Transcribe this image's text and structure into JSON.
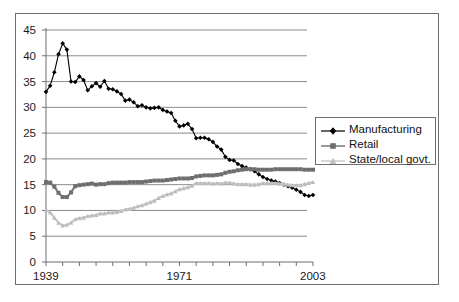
{
  "chart_data": {
    "type": "line",
    "title": "",
    "subtitle": "",
    "xlabel": "",
    "ylabel": "",
    "xlim": [
      1939,
      2003
    ],
    "ylim": [
      0,
      45
    ],
    "grid": true,
    "grid_axis": "y",
    "legend_position": "inside-right",
    "ytick_labels": [
      "0",
      "5",
      "10",
      "15",
      "20",
      "25",
      "30",
      "35",
      "40",
      "45"
    ],
    "ytick_values": [
      0,
      5,
      10,
      15,
      20,
      25,
      30,
      35,
      40,
      45
    ],
    "xtick_labels": [
      "1939",
      "1971",
      "2003"
    ],
    "xtick_values": [
      1939,
      1971,
      2003
    ],
    "xtick_minor_step": 4,
    "colors": {
      "manufacturing": "#000000",
      "retail": "#7f7f7f",
      "state_local": "#c8c8c8",
      "grid": "#8c8c8c",
      "axis": "#6f6f6f",
      "text": "#1a1a1a",
      "background": "#ffffff"
    },
    "x": [
      1939,
      1940,
      1941,
      1942,
      1943,
      1944,
      1945,
      1946,
      1947,
      1948,
      1949,
      1950,
      1951,
      1952,
      1953,
      1954,
      1955,
      1956,
      1957,
      1958,
      1959,
      1960,
      1961,
      1962,
      1963,
      1964,
      1965,
      1966,
      1967,
      1968,
      1969,
      1970,
      1971,
      1972,
      1973,
      1974,
      1975,
      1976,
      1977,
      1978,
      1979,
      1980,
      1981,
      1982,
      1983,
      1984,
      1985,
      1986,
      1987,
      1988,
      1989,
      1990,
      1991,
      1992,
      1993,
      1994,
      1995,
      1996,
      1997,
      1998,
      1999,
      2000,
      2001,
      2002,
      2003
    ],
    "series": [
      {
        "name": "Manufacturing",
        "marker": "diamond",
        "color": "#000000",
        "values": [
          33.0,
          34.2,
          36.8,
          40.3,
          42.4,
          41.2,
          35.0,
          34.9,
          36.0,
          35.3,
          33.3,
          34.1,
          34.7,
          34.0,
          35.1,
          33.6,
          33.5,
          33.1,
          32.6,
          31.3,
          31.5,
          31.0,
          30.2,
          30.4,
          30.0,
          29.8,
          29.9,
          30.0,
          29.5,
          29.2,
          28.9,
          27.4,
          26.3,
          26.5,
          26.8,
          25.8,
          24.0,
          24.1,
          24.1,
          23.8,
          23.3,
          22.4,
          21.8,
          20.4,
          19.8,
          19.7,
          19.0,
          18.6,
          18.3,
          18.0,
          17.6,
          17.0,
          16.5,
          16.1,
          15.8,
          15.6,
          15.3,
          15.0,
          14.7,
          14.4,
          14.0,
          13.6,
          13.0,
          12.8,
          13.0
        ]
      },
      {
        "name": "Retail",
        "marker": "square",
        "color": "#7f7f7f",
        "values": [
          15.5,
          15.4,
          14.6,
          13.4,
          12.6,
          12.6,
          13.5,
          14.7,
          14.9,
          15.0,
          15.1,
          15.2,
          15.0,
          15.1,
          15.1,
          15.3,
          15.4,
          15.4,
          15.4,
          15.4,
          15.5,
          15.5,
          15.5,
          15.5,
          15.6,
          15.7,
          15.8,
          15.8,
          15.8,
          15.9,
          16.0,
          16.1,
          16.2,
          16.2,
          16.2,
          16.3,
          16.6,
          16.7,
          16.8,
          16.8,
          16.8,
          16.9,
          17.0,
          17.3,
          17.5,
          17.6,
          17.8,
          17.9,
          18.0,
          18.0,
          18.0,
          17.9,
          17.9,
          17.9,
          17.9,
          18.0,
          18.0,
          18.0,
          18.0,
          18.0,
          18.0,
          18.0,
          17.9,
          17.9,
          17.9
        ]
      },
      {
        "name": "State/local govt.",
        "marker": "triangle",
        "color": "#c8c8c8",
        "values": [
          10.1,
          9.6,
          8.6,
          7.6,
          7.1,
          7.2,
          7.6,
          8.3,
          8.5,
          8.6,
          8.9,
          9.0,
          9.1,
          9.4,
          9.4,
          9.6,
          9.6,
          9.7,
          9.9,
          10.2,
          10.3,
          10.5,
          10.8,
          11.0,
          11.3,
          11.6,
          11.9,
          12.4,
          12.8,
          13.1,
          13.3,
          13.7,
          14.1,
          14.3,
          14.5,
          14.8,
          15.3,
          15.3,
          15.3,
          15.3,
          15.2,
          15.3,
          15.2,
          15.4,
          15.4,
          15.2,
          15.1,
          15.1,
          15.1,
          15.0,
          15.0,
          15.1,
          15.3,
          15.3,
          15.3,
          15.3,
          15.2,
          15.1,
          15.0,
          14.9,
          14.9,
          14.9,
          15.1,
          15.3,
          15.5
        ]
      }
    ]
  }
}
